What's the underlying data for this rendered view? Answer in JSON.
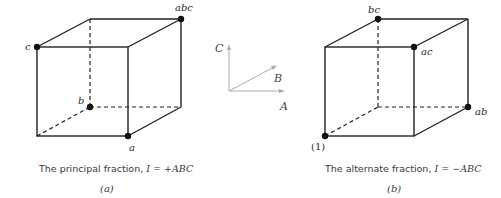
{
  "figure": {
    "panel_a": {
      "vertex_labels": {
        "abc": "abc",
        "c": "c",
        "b": "b",
        "a": "a"
      },
      "caption_text": "The principal fraction, ",
      "caption_math": "I = +ABC",
      "sublabel": "(a)"
    },
    "axes": {
      "x_label": "A",
      "y_label": "B",
      "z_label": "C"
    },
    "panel_b": {
      "vertex_labels": {
        "bc": "bc",
        "ac": "ac",
        "ab": "ab",
        "one": "(1)"
      },
      "caption_text": "The alternate fraction, ",
      "caption_math": "I = −ABC",
      "sublabel": "(b)"
    },
    "colors": {
      "line": "#222222",
      "axis": "#aaaaaa",
      "dot": "#111111"
    }
  }
}
